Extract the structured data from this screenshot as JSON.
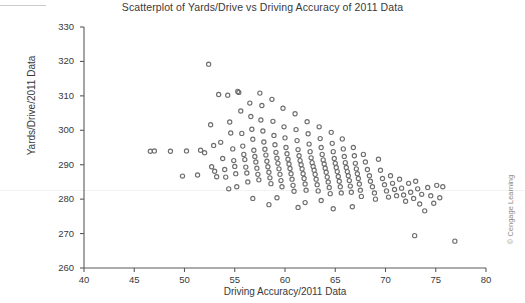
{
  "chart_data": {
    "type": "scatter",
    "title": "Scatterplot of Yards/Drive vs Driving Accuracy of 2011 Data",
    "xlabel": "Driving Accuracy/2011 Data",
    "ylabel": "Yards/Drive/2011 Data",
    "xlim": [
      40,
      80
    ],
    "ylim": [
      260,
      330
    ],
    "xticks": [
      40,
      45,
      50,
      55,
      60,
      65,
      70,
      75,
      80
    ],
    "yticks": [
      260,
      270,
      280,
      290,
      300,
      310,
      320,
      330
    ],
    "grid": false,
    "legend": null,
    "marker": "open-circle",
    "marker_color": "#6e6e6e",
    "point_count": 190,
    "points": [
      [
        46.6,
        293.9
      ],
      [
        47.0,
        294.0
      ],
      [
        48.6,
        293.9
      ],
      [
        49.8,
        286.7
      ],
      [
        50.2,
        294.0
      ],
      [
        51.3,
        287.0
      ],
      [
        51.6,
        294.2
      ],
      [
        52.0,
        293.5
      ],
      [
        52.4,
        319.2
      ],
      [
        52.6,
        301.6
      ],
      [
        52.7,
        289.4
      ],
      [
        53.0,
        288.1
      ],
      [
        53.2,
        286.5
      ],
      [
        53.4,
        310.4
      ],
      [
        53.6,
        296.5
      ],
      [
        53.8,
        291.8
      ],
      [
        54.0,
        288.6
      ],
      [
        54.1,
        286.4
      ],
      [
        54.3,
        310.2
      ],
      [
        54.5,
        302.4
      ],
      [
        54.6,
        299.2
      ],
      [
        54.8,
        294.6
      ],
      [
        54.9,
        291.2
      ],
      [
        55.0,
        289.5
      ],
      [
        55.1,
        287.4
      ],
      [
        55.3,
        311.3
      ],
      [
        55.4,
        311.0
      ],
      [
        55.6,
        305.6
      ],
      [
        55.7,
        299.1
      ],
      [
        55.8,
        295.4
      ],
      [
        55.9,
        293.0
      ],
      [
        56.0,
        291.5
      ],
      [
        56.1,
        289.3
      ],
      [
        56.2,
        287.6
      ],
      [
        56.3,
        285.0
      ],
      [
        56.5,
        307.9
      ],
      [
        56.6,
        304.0
      ],
      [
        56.7,
        300.3
      ],
      [
        56.8,
        297.4
      ],
      [
        56.9,
        294.2
      ],
      [
        57.0,
        292.4
      ],
      [
        57.1,
        290.8
      ],
      [
        57.2,
        289.0
      ],
      [
        57.3,
        287.2
      ],
      [
        57.4,
        285.6
      ],
      [
        57.5,
        310.8
      ],
      [
        57.6,
        303.0
      ],
      [
        57.8,
        299.8
      ],
      [
        57.9,
        296.6
      ],
      [
        58.0,
        294.5
      ],
      [
        58.1,
        292.8
      ],
      [
        58.2,
        291.0
      ],
      [
        58.3,
        289.4
      ],
      [
        58.4,
        287.8
      ],
      [
        58.5,
        286.2
      ],
      [
        58.6,
        284.5
      ],
      [
        58.7,
        309.0
      ],
      [
        58.8,
        302.6
      ],
      [
        58.9,
        298.5
      ],
      [
        59.0,
        295.8
      ],
      [
        59.1,
        293.6
      ],
      [
        59.2,
        291.9
      ],
      [
        59.3,
        290.4
      ],
      [
        59.4,
        288.8
      ],
      [
        59.5,
        287.2
      ],
      [
        59.6,
        285.4
      ],
      [
        59.7,
        283.6
      ],
      [
        59.8,
        306.4
      ],
      [
        59.9,
        301.0
      ],
      [
        60.0,
        297.8
      ],
      [
        60.1,
        295.0
      ],
      [
        60.2,
        293.2
      ],
      [
        60.3,
        291.6
      ],
      [
        60.4,
        290.2
      ],
      [
        60.5,
        288.9
      ],
      [
        60.6,
        287.4
      ],
      [
        60.7,
        285.8
      ],
      [
        60.8,
        284.0
      ],
      [
        60.9,
        282.3
      ],
      [
        61.0,
        304.8
      ],
      [
        61.1,
        300.2
      ],
      [
        61.2,
        297.0
      ],
      [
        61.3,
        294.4
      ],
      [
        61.4,
        292.6
      ],
      [
        61.5,
        291.2
      ],
      [
        61.6,
        290.0
      ],
      [
        61.7,
        288.8
      ],
      [
        61.8,
        287.4
      ],
      [
        61.9,
        286.0
      ],
      [
        62.0,
        284.4
      ],
      [
        62.1,
        282.6
      ],
      [
        62.2,
        302.5
      ],
      [
        62.3,
        299.0
      ],
      [
        62.4,
        296.0
      ],
      [
        62.5,
        293.8
      ],
      [
        62.6,
        292.0
      ],
      [
        62.7,
        290.6
      ],
      [
        62.8,
        289.5
      ],
      [
        62.9,
        288.4
      ],
      [
        63.0,
        287.2
      ],
      [
        63.1,
        285.8
      ],
      [
        63.2,
        284.2
      ],
      [
        63.3,
        282.4
      ],
      [
        63.4,
        301.0
      ],
      [
        63.5,
        297.6
      ],
      [
        63.6,
        295.0
      ],
      [
        63.7,
        293.0
      ],
      [
        63.8,
        291.4
      ],
      [
        63.9,
        290.2
      ],
      [
        64.0,
        289.0
      ],
      [
        64.1,
        287.8
      ],
      [
        64.2,
        286.4
      ],
      [
        64.3,
        285.0
      ],
      [
        64.4,
        283.4
      ],
      [
        64.5,
        281.6
      ],
      [
        64.6,
        299.4
      ],
      [
        64.7,
        296.2
      ],
      [
        64.8,
        293.8
      ],
      [
        64.9,
        291.8
      ],
      [
        65.0,
        290.4
      ],
      [
        65.1,
        289.2
      ],
      [
        65.2,
        288.0
      ],
      [
        65.3,
        286.6
      ],
      [
        65.4,
        285.2
      ],
      [
        65.5,
        283.6
      ],
      [
        65.6,
        281.8
      ],
      [
        65.7,
        297.5
      ],
      [
        65.8,
        294.6
      ],
      [
        65.9,
        292.4
      ],
      [
        66.0,
        290.6
      ],
      [
        66.1,
        289.2
      ],
      [
        66.2,
        288.0
      ],
      [
        66.3,
        286.8
      ],
      [
        66.4,
        285.4
      ],
      [
        66.5,
        283.8
      ],
      [
        66.6,
        282.0
      ],
      [
        66.8,
        295.0
      ],
      [
        66.9,
        292.6
      ],
      [
        67.0,
        290.4
      ],
      [
        67.1,
        288.8
      ],
      [
        67.2,
        287.4
      ],
      [
        67.3,
        286.0
      ],
      [
        67.4,
        284.4
      ],
      [
        67.5,
        282.6
      ],
      [
        67.6,
        280.8
      ],
      [
        67.8,
        293.0
      ],
      [
        68.0,
        290.8
      ],
      [
        68.2,
        288.6
      ],
      [
        68.4,
        286.8
      ],
      [
        68.5,
        285.2
      ],
      [
        68.7,
        283.6
      ],
      [
        68.9,
        281.8
      ],
      [
        69.0,
        280.0
      ],
      [
        69.3,
        291.6
      ],
      [
        69.5,
        288.4
      ],
      [
        69.7,
        286.0
      ],
      [
        69.9,
        284.2
      ],
      [
        70.1,
        282.4
      ],
      [
        70.3,
        280.6
      ],
      [
        70.5,
        286.8
      ],
      [
        70.7,
        284.6
      ],
      [
        70.9,
        282.8
      ],
      [
        71.1,
        281.0
      ],
      [
        71.4,
        285.8
      ],
      [
        71.6,
        283.2
      ],
      [
        71.8,
        281.2
      ],
      [
        72.0,
        279.4
      ],
      [
        72.3,
        284.6
      ],
      [
        72.5,
        282.0
      ],
      [
        72.8,
        280.2
      ],
      [
        73.0,
        285.2
      ],
      [
        73.2,
        283.0
      ],
      [
        73.4,
        278.6
      ],
      [
        73.6,
        281.4
      ],
      [
        73.9,
        276.6
      ],
      [
        74.2,
        283.4
      ],
      [
        74.5,
        281.0
      ],
      [
        74.8,
        278.8
      ],
      [
        75.1,
        284.0
      ],
      [
        75.4,
        280.4
      ],
      [
        75.7,
        283.6
      ],
      [
        72.9,
        269.4
      ],
      [
        76.9,
        267.8
      ],
      [
        61.3,
        277.6
      ],
      [
        64.8,
        277.2
      ],
      [
        66.7,
        277.8
      ],
      [
        58.4,
        278.4
      ],
      [
        56.8,
        280.2
      ],
      [
        62.0,
        279.0
      ],
      [
        63.6,
        279.6
      ],
      [
        59.2,
        280.4
      ],
      [
        54.4,
        283.0
      ],
      [
        55.2,
        283.6
      ],
      [
        52.9,
        295.6
      ],
      [
        57.7,
        307.2
      ]
    ]
  },
  "credit": "© Cengage Learning"
}
